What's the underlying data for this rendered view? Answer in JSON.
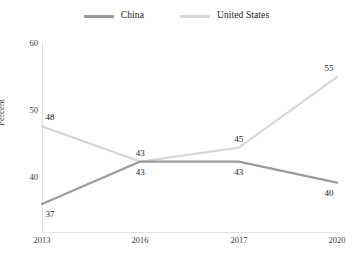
{
  "chart_data": {
    "type": "line",
    "title": "",
    "xlabel": "",
    "ylabel": "Percent",
    "categories": [
      "2013",
      "2016",
      "2017",
      "2020"
    ],
    "ylim": [
      33,
      60
    ],
    "yticks": [
      40,
      50,
      60
    ],
    "grid": false,
    "legend_position": "top-center",
    "series": [
      {
        "name": "China",
        "color": "#9a9a9a",
        "values": [
          37,
          43,
          43,
          40
        ],
        "labels": [
          "37",
          "43",
          "43",
          "40"
        ]
      },
      {
        "name": "United States",
        "color": "#d8d8d8",
        "values": [
          48,
          43,
          45,
          55
        ],
        "labels": [
          "48",
          "43",
          "45",
          "55"
        ]
      }
    ]
  },
  "legend": {
    "items": [
      {
        "label": "China",
        "color": "#9a9a9a"
      },
      {
        "label": "United States",
        "color": "#d8d8d8"
      }
    ]
  },
  "axes": {
    "y_title": "Percent",
    "y_tick_labels": [
      "60",
      "50",
      "40"
    ],
    "x_tick_labels": [
      "2013",
      "2016",
      "2017",
      "2020"
    ]
  },
  "colors": {
    "china_line": "#9a9a9a",
    "us_line": "#d8d8d8",
    "axis": "#e2e2e2",
    "text": "#222222",
    "background": "#ffffff"
  },
  "point_labels": {
    "china": [
      "37",
      "43",
      "43",
      "40"
    ],
    "united_states": [
      "48",
      "43",
      "45",
      "55"
    ]
  }
}
